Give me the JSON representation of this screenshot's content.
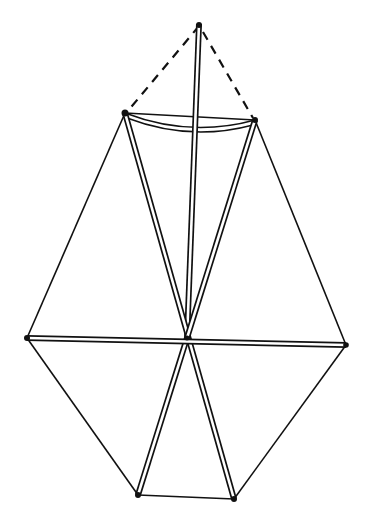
{
  "diagram": {
    "type": "kite-frame-line-drawing",
    "stroke_color": "#111111",
    "background": "#ffffff",
    "points": {
      "apex": [
        199,
        24
      ],
      "upper_left": [
        125,
        113
      ],
      "upper_right": [
        255,
        120
      ],
      "left": [
        27,
        338
      ],
      "right": [
        346,
        345
      ],
      "center": [
        187,
        340
      ],
      "lower_left": [
        138,
        495
      ],
      "lower_right": [
        234,
        499
      ]
    }
  }
}
